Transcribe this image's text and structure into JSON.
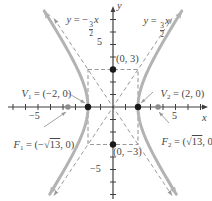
{
  "chart_data": {
    "type": "line",
    "a": 2,
    "b": 3,
    "vertices": [
      [
        -2,
        0
      ],
      [
        2,
        0
      ]
    ],
    "foci": [
      [
        -3.6056,
        0
      ],
      [
        3.6056,
        0
      ]
    ],
    "conjugate_points": [
      [
        0,
        3
      ],
      [
        0,
        -3
      ]
    ],
    "asymptote_slopes": [
      1.5,
      -1.5
    ],
    "asymptote_equations": [
      "y = (3/2)x",
      "y = -(3/2)x"
    ],
    "x_ticks_labeled": [
      -5,
      5
    ],
    "y_ticks_labeled": [
      -5,
      5
    ],
    "xlim": [
      -8.4,
      7.4
    ],
    "ylim": [
      -7.5,
      8.2
    ],
    "grid": false,
    "styles": {
      "curve_color": "#b3b3b3",
      "dash_color": "#999999",
      "axis_color": "#3f3f3f",
      "point_color": "#1a1a1a",
      "focus_color": "#8c8c8c"
    }
  },
  "labels": {
    "axis_x": "x",
    "axis_y": "y",
    "tick_x_neg": "−5",
    "tick_x_pos": "5",
    "tick_y_pos": "5",
    "tick_y_neg": "−5",
    "point_top": "(0, 3)",
    "point_bottom": "(0, −3)",
    "asymptote_left": {
      "y": "y",
      "pre": " = −",
      "num": "3",
      "den": "2",
      "x": "x"
    },
    "asymptote_right": {
      "y": "y",
      "pre": " = ",
      "num": "3",
      "den": "2",
      "x": "x"
    },
    "v1": {
      "name": "V",
      "sub": "1",
      "value": " = (−2, 0)"
    },
    "v2": {
      "name": "V",
      "sub": "2",
      "value": " = (2, 0)"
    },
    "f1": {
      "name": "F",
      "sub": "1",
      "open": " = (−√",
      "rad": "13",
      "close": ", 0)"
    },
    "f2": {
      "name": "F",
      "sub": "2",
      "open": " = (√",
      "rad": "13",
      "close": ", 0)"
    }
  }
}
